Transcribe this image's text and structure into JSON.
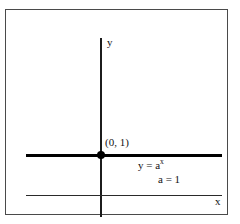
{
  "figure": {
    "background_color": "#ffffff",
    "frame_color": "#4a4a4a",
    "ink_color": "#000000",
    "width": 240,
    "height": 224
  },
  "axes": {
    "y_axis_label": "y",
    "x_axis_label": "x"
  },
  "annotations": {
    "intercept_label": "(0, 1)",
    "equation_base": "y = a",
    "equation_exponent": "x",
    "parameter_label": "a = 1"
  },
  "chart_data": {
    "type": "line",
    "title": "",
    "subtitle": "",
    "xlabel": "x",
    "ylabel": "y",
    "grid": false,
    "legend": "none",
    "xlim": [
      -4.5,
      7.5
    ],
    "ylim": [
      -0.6,
      3.2
    ],
    "series": [
      {
        "name": "y = a^x, a = 1",
        "style": "thick-solid",
        "color": "#000000",
        "x": [
          -4.5,
          -3,
          -1.5,
          0,
          1.5,
          3,
          4.5,
          6,
          7.5
        ],
        "values": [
          1,
          1,
          1,
          1,
          1,
          1,
          1,
          1,
          1
        ]
      }
    ],
    "points": [
      {
        "label": "(0, 1)",
        "x": 0,
        "y": 1,
        "marker": "filled-circle"
      }
    ],
    "annotations": [
      {
        "text": "y = a^x",
        "x": 2.3,
        "y": 0.78
      },
      {
        "text": "a = 1",
        "x": 3.6,
        "y": 0.48
      }
    ]
  }
}
